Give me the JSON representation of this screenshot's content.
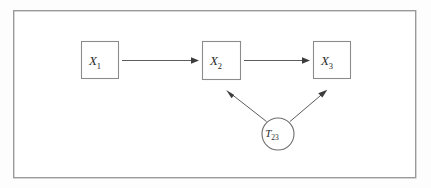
{
  "figure": {
    "type": "causal-path-diagram",
    "background_color": "#fdfdfd",
    "frame": {
      "name": "outer-frame",
      "fill": "#ffffff",
      "stroke": "#9a9a9a",
      "x": 13,
      "y": 10,
      "width": 403,
      "height": 168
    },
    "nodes": [
      {
        "id": "x1",
        "shape": "rect",
        "label_base": "X",
        "label_sub": "1",
        "x": 81,
        "y": 41,
        "width": 37,
        "height": 37
      },
      {
        "id": "x2",
        "shape": "rect",
        "label_base": "X",
        "label_sub": "2",
        "x": 202,
        "y": 41,
        "width": 38,
        "height": 38
      },
      {
        "id": "x3",
        "shape": "rect",
        "label_base": "X",
        "label_sub": "3",
        "x": 313,
        "y": 41,
        "width": 37,
        "height": 37
      },
      {
        "id": "t23",
        "shape": "circle",
        "label_base": "T",
        "label_sub": "23",
        "cx": 278,
        "cy": 134,
        "r": 16
      }
    ],
    "edges": [
      {
        "id": "x1-to-x2",
        "from": "x1",
        "to": "x2",
        "style": "straight-arrow"
      },
      {
        "id": "x2-to-x3",
        "from": "x2",
        "to": "x3",
        "style": "straight-arrow"
      },
      {
        "id": "t23-to-x2",
        "from": "t23",
        "to": "x2",
        "style": "diagonal-arrow"
      },
      {
        "id": "t23-to-x3",
        "from": "t23",
        "to": "x3",
        "style": "diagonal-arrow"
      }
    ],
    "colors": {
      "edge": "#4a4a4a",
      "arrow_head": "#3c3c3c",
      "node_stroke": "#8c8c8c",
      "frame_stroke": "#9a9a9a",
      "text": "#2b2b2b"
    }
  }
}
